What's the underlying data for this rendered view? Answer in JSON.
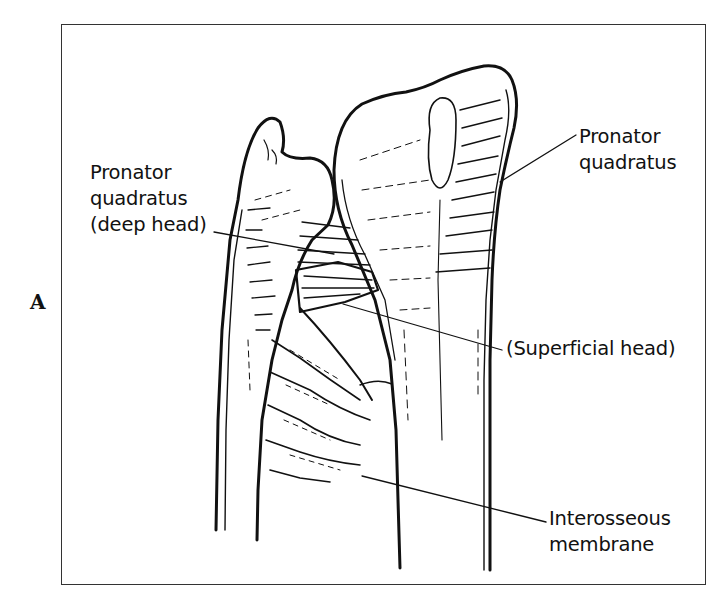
{
  "figure": {
    "panel_letter": "A"
  },
  "labels": {
    "pronator_deep": {
      "line1": "Pronator",
      "line2": "quadratus",
      "line3": "(deep head)"
    },
    "pronator_right": {
      "line1": "Pronator",
      "line2": "quadratus"
    },
    "superficial_head": {
      "text": "(Superficial head)"
    },
    "interosseous": {
      "line1": "Interosseous",
      "line2": "membrane"
    }
  },
  "colors": {
    "ink": "#111111",
    "frame": "#333333",
    "background": "#ffffff"
  }
}
